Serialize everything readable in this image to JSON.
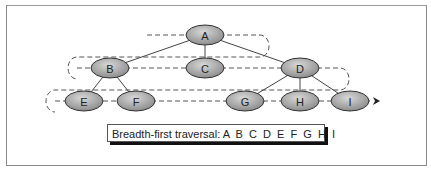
{
  "diagram": {
    "title": "Breadth-first traversal",
    "nodes": [
      {
        "id": "A",
        "label": "A",
        "level": 0
      },
      {
        "id": "B",
        "label": "B",
        "level": 1
      },
      {
        "id": "C",
        "label": "C",
        "level": 1
      },
      {
        "id": "D",
        "label": "D",
        "level": 1
      },
      {
        "id": "E",
        "label": "E",
        "level": 2
      },
      {
        "id": "F",
        "label": "F",
        "level": 2
      },
      {
        "id": "G",
        "label": "G",
        "level": 2
      },
      {
        "id": "H",
        "label": "H",
        "level": 2
      },
      {
        "id": "I",
        "label": "I",
        "level": 2
      }
    ],
    "edges": [
      [
        "A",
        "B"
      ],
      [
        "A",
        "C"
      ],
      [
        "A",
        "D"
      ],
      [
        "B",
        "E"
      ],
      [
        "B",
        "F"
      ],
      [
        "D",
        "G"
      ],
      [
        "D",
        "H"
      ],
      [
        "D",
        "I"
      ]
    ],
    "traversal_order": [
      "A",
      "B",
      "C",
      "D",
      "E",
      "F",
      "G",
      "H",
      "I"
    ],
    "caption_prefix": "Breadth-first traversal:",
    "caption_sequence": "A  B  C  D  E  F  G  H  I",
    "colors": {
      "node_fill": "#9a9a9a",
      "node_stroke": "#333333",
      "edge": "#444444",
      "path": "#555555"
    }
  }
}
